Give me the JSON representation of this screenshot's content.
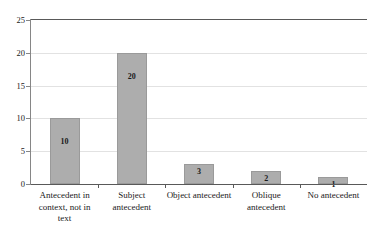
{
  "chart_data": {
    "type": "bar",
    "title": "",
    "xlabel": "",
    "ylabel": "",
    "categories": [
      "Antecedent in context, not in text",
      "Subject antecedent",
      "Object antecedent",
      "Oblique antecedent",
      "No antecedent"
    ],
    "values": [
      10,
      20,
      3,
      2,
      1
    ],
    "data_labels": [
      "10",
      "20",
      "3",
      "2",
      "1"
    ],
    "ylim": [
      0,
      25
    ],
    "y_ticks": [
      0,
      5,
      10,
      15,
      20,
      25
    ],
    "y_tick_labels": [
      "0",
      "5",
      "10",
      "15",
      "20",
      "25"
    ],
    "grid": true,
    "legend": false,
    "legend_position": "none",
    "colors": {
      "bar_fill": "#adadad",
      "bar_border": "#9a9a9a",
      "gridline": "#e2e2e2",
      "axis": "#595959",
      "text": "#1a1a1a",
      "background": "#ffffff"
    }
  }
}
